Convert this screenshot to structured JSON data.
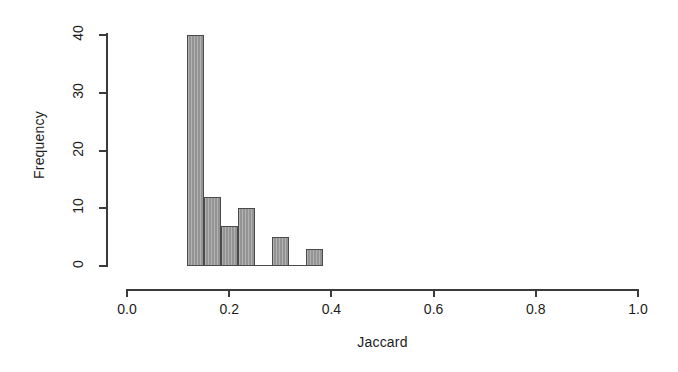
{
  "chart_data": {
    "type": "bar",
    "title": "",
    "subtitle": "",
    "xlabel": "Jaccard",
    "ylabel": "Frequency",
    "xlim": [
      0.0,
      1.0
    ],
    "ylim": [
      0,
      40
    ],
    "grid": false,
    "legend": null,
    "x_ticks": [
      "0.0",
      "0.2",
      "0.4",
      "0.6",
      "0.8",
      "1.0"
    ],
    "x_tick_values": [
      0.0,
      0.2,
      0.4,
      0.6,
      0.8,
      1.0
    ],
    "y_ticks": [
      "0",
      "10",
      "20",
      "30",
      "40"
    ],
    "y_tick_values": [
      0,
      10,
      20,
      30,
      40
    ],
    "bin_width": 0.0333,
    "bins": [
      {
        "left": 0.1167,
        "right": 0.15,
        "value": 40
      },
      {
        "left": 0.15,
        "right": 0.1833,
        "value": 12
      },
      {
        "left": 0.1833,
        "right": 0.2167,
        "value": 7
      },
      {
        "left": 0.2167,
        "right": 0.25,
        "value": 10
      },
      {
        "left": 0.25,
        "right": 0.2833,
        "value": 0
      },
      {
        "left": 0.2833,
        "right": 0.3167,
        "value": 5
      },
      {
        "left": 0.3167,
        "right": 0.35,
        "value": 0
      },
      {
        "left": 0.35,
        "right": 0.3833,
        "value": 3
      }
    ],
    "categories": [
      "0.1167",
      "0.15",
      "0.1833",
      "0.2167",
      "0.25",
      "0.2833",
      "0.3167",
      "0.35"
    ],
    "values": [
      40,
      12,
      7,
      10,
      0,
      5,
      0,
      3
    ],
    "bar_fill_color": "#9c9c9c",
    "bar_border_color": "#4a4a4a",
    "axis_color": "#3b3b3b",
    "background_color": "#ffffff"
  }
}
